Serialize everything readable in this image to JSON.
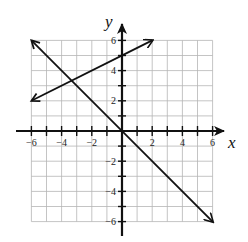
{
  "chart_data": {
    "type": "line",
    "title": "",
    "xlabel": "x",
    "ylabel": "y",
    "xlim": [
      -6,
      6
    ],
    "ylim": [
      -6,
      6
    ],
    "grid": true,
    "x_ticks": [
      -6,
      -4,
      -2,
      2,
      4,
      6
    ],
    "y_ticks": [
      -6,
      -4,
      -2,
      2,
      4,
      6
    ],
    "series": [
      {
        "name": "y = 0.5x + 5",
        "points": [
          [
            -6,
            2
          ],
          [
            2,
            6
          ]
        ],
        "arrows": "both"
      },
      {
        "name": "y = -x",
        "points": [
          [
            -6,
            6
          ],
          [
            6,
            -6
          ]
        ],
        "arrows": "both"
      }
    ]
  },
  "labels": {
    "x_axis": "x",
    "y_axis": "y",
    "x_tick_labels": [
      "-6",
      "-4",
      "-2",
      "2",
      "4",
      "6"
    ],
    "y_tick_labels": [
      "6",
      "4",
      "2",
      "-2",
      "-4",
      "-6"
    ]
  }
}
